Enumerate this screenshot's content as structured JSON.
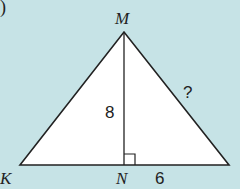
{
  "figure": {
    "part_marker": ")",
    "vertices": {
      "apex": "M",
      "left": "K",
      "foot": "N"
    },
    "labels": {
      "height": "8",
      "base_segment": "6",
      "unknown_side": "?"
    },
    "colors": {
      "background": "#c6e3e6",
      "fill": "#ffffff",
      "stroke": "#222222"
    }
  }
}
